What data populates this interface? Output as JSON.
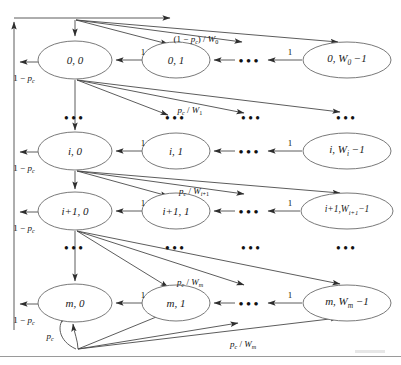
{
  "figure": {
    "type": "state-transition-diagram",
    "bg_color": "#ffffff",
    "line_color": "#4a4a4a",
    "text_color": "#111111"
  },
  "nodes": [
    {
      "id": "s00",
      "label": "0, 0",
      "row": 0,
      "col": 0,
      "cx": 75,
      "cy": 60,
      "rx": 37,
      "ry": 19
    },
    {
      "id": "s01",
      "label": "0, 1",
      "row": 0,
      "col": 1,
      "cx": 176,
      "cy": 60,
      "rx": 34,
      "ry": 18
    },
    {
      "id": "s0W",
      "label": "0, W_0 - 1",
      "row": 0,
      "col": 3,
      "cx": 347,
      "cy": 60,
      "rx": 44,
      "ry": 18
    },
    {
      "id": "si0",
      "label": "i, 0",
      "row": 1,
      "col": 0,
      "cx": 75,
      "cy": 151,
      "rx": 37,
      "ry": 19
    },
    {
      "id": "si1",
      "label": "i, 1",
      "row": 1,
      "col": 1,
      "cx": 176,
      "cy": 151,
      "rx": 34,
      "ry": 18
    },
    {
      "id": "siW",
      "label": "i, W_i - 1",
      "row": 1,
      "col": 3,
      "cx": 347,
      "cy": 151,
      "rx": 44,
      "ry": 18
    },
    {
      "id": "si10",
      "label": "i+1, 0",
      "row": 2,
      "col": 0,
      "cx": 75,
      "cy": 211,
      "rx": 37,
      "ry": 19
    },
    {
      "id": "si11",
      "label": "i+1, 1",
      "row": 2,
      "col": 1,
      "cx": 176,
      "cy": 211,
      "rx": 34,
      "ry": 18
    },
    {
      "id": "si1W",
      "label": "i+1, W_{i+1} - 1",
      "row": 2,
      "col": 3,
      "cx": 347,
      "cy": 211,
      "rx": 46,
      "ry": 18
    },
    {
      "id": "sm0",
      "label": "m, 0",
      "row": 3,
      "col": 0,
      "cx": 75,
      "cy": 303,
      "rx": 37,
      "ry": 19
    },
    {
      "id": "sm1",
      "label": "m, 1",
      "row": 3,
      "col": 1,
      "cx": 176,
      "cy": 303,
      "rx": 34,
      "ry": 18
    },
    {
      "id": "smW",
      "label": "m, W_m - 1",
      "row": 3,
      "col": 3,
      "cx": 347,
      "cy": 303,
      "rx": 44,
      "ry": 18
    }
  ],
  "node_labels": {
    "s00": {
      "html": "0, 0"
    },
    "s01": {
      "html": "0, 1"
    },
    "s0W": {
      "html": "0, <span class=\"ital\">W</span><sub>0</sub> &#8722;1"
    },
    "si0": {
      "html": "<span class=\"ital\">i</span>, 0"
    },
    "si1": {
      "html": "<span class=\"ital\">i</span>, 1"
    },
    "siW": {
      "html": "<span class=\"ital\">i</span>, <span class=\"ital\">W</span><sub><span class=\"ital\">i</span></sub> &#8722;1"
    },
    "si10": {
      "html": "<span class=\"ital\">i</span>+1, 0"
    },
    "si11": {
      "html": "<span class=\"ital\">i</span>+1, 1"
    },
    "si1W": {
      "html": "<span class=\"ital\">i</span>+1,<span class=\"ital\">W</span><sub><span class=\"ital\">i</span>+1</sub>&#8722;1"
    },
    "sm0": {
      "html": "<span class=\"ital\">m</span>, 0"
    },
    "sm1": {
      "html": "<span class=\"ital\">m</span>, 1"
    },
    "smW": {
      "html": "<span class=\"ital\">m</span>, <span class=\"ital\">W</span><sub><span class=\"ital\">m</span></sub> &#8722;1"
    }
  },
  "edge_labels": [
    {
      "id": "lbl-1mpc-row0",
      "html": "1 &#8722; <span class=\"ital\">p</span><sub><span class=\"ital\">c</span></sub>",
      "x": 24,
      "y": 79,
      "size": 9
    },
    {
      "id": "lbl-1mpc-rowi",
      "html": "1 &#8722; <span class=\"ital\">p</span><sub><span class=\"ital\">c</span></sub>",
      "x": 24,
      "y": 169,
      "size": 9
    },
    {
      "id": "lbl-1mpc-rowi1",
      "html": "1 &#8722; <span class=\"ital\">p</span><sub><span class=\"ital\">c</span></sub>",
      "x": 24,
      "y": 229,
      "size": 9
    },
    {
      "id": "lbl-1mpc-rowm",
      "html": "1 &#8722; <span class=\"ital\">p</span><sub><span class=\"ital\">c</span></sub>",
      "x": 24,
      "y": 321,
      "size": 9
    },
    {
      "id": "lbl-1mpc-W0",
      "html": "(1 &#8722; <span class=\"ital\">p</span><sub><span class=\"ital\">c</span></sub>) / <span class=\"ital\">W</span><sub>0</sub>",
      "x": 196,
      "y": 40,
      "size": 9
    },
    {
      "id": "lbl-pc-W1",
      "html": "<span class=\"ital\">p</span><sub><span class=\"ital\">c</span></sub> / <span class=\"ital\">W</span><sub>1</sub>",
      "x": 190,
      "y": 111,
      "size": 9
    },
    {
      "id": "lbl-pc-Wi1",
      "html": "<span class=\"ital\">p</span><sub><span class=\"ital\">c</span></sub> / <span class=\"ital\">W</span><sub><span class=\"ital\">i</span>+1</sub>",
      "x": 194,
      "y": 192,
      "size": 9
    },
    {
      "id": "lbl-pc-Wm",
      "html": "<span class=\"ital\">p</span><sub><span class=\"ital\">c</span></sub> / <span class=\"ital\">W</span><sub><span class=\"ital\">m</span></sub>",
      "x": 190,
      "y": 283,
      "size": 9
    },
    {
      "id": "lbl-pc-self",
      "html": "<span class=\"ital\">p</span><sub><span class=\"ital\">c</span></sub>",
      "x": 50,
      "y": 337,
      "size": 9
    },
    {
      "id": "lbl-pc-Wm-bot",
      "html": "<span class=\"ital\">p</span><sub><span class=\"ital\">c</span></sub> / <span class=\"ital\">W</span><sub><span class=\"ital\">m</span></sub>",
      "x": 243,
      "y": 345,
      "size": 9
    },
    {
      "id": "lbl-one-r0c1",
      "html": "1",
      "x": 143,
      "y": 52,
      "size": 9
    },
    {
      "id": "lbl-one-r0c2",
      "html": "1",
      "x": 290,
      "y": 52,
      "size": 9
    },
    {
      "id": "lbl-one-r1c1",
      "html": "1",
      "x": 143,
      "y": 143,
      "size": 9
    },
    {
      "id": "lbl-one-r1c2",
      "html": "1",
      "x": 290,
      "y": 143,
      "size": 9
    },
    {
      "id": "lbl-one-r2c1",
      "html": "1",
      "x": 143,
      "y": 203,
      "size": 9
    },
    {
      "id": "lbl-one-r2c2",
      "html": "1",
      "x": 290,
      "y": 203,
      "size": 9
    },
    {
      "id": "lbl-one-r3c1",
      "html": "1",
      "x": 143,
      "y": 295,
      "size": 9
    },
    {
      "id": "lbl-one-r3c2",
      "html": "1",
      "x": 290,
      "y": 295,
      "size": 9
    }
  ],
  "horizontal_ellipses": [
    {
      "id": "hdots-row0",
      "x": 250,
      "y": 60
    },
    {
      "id": "hdots-row1",
      "x": 250,
      "y": 151
    },
    {
      "id": "hdots-row2",
      "x": 250,
      "y": 211
    },
    {
      "id": "hdots-row3",
      "x": 250,
      "y": 303
    }
  ],
  "vertical_ellipses": [
    {
      "id": "vdots-a-c0",
      "x": 75,
      "y": 118
    },
    {
      "id": "vdots-a-c1",
      "x": 176,
      "y": 118
    },
    {
      "id": "vdots-a-c2",
      "x": 252,
      "y": 118
    },
    {
      "id": "vdots-a-c3",
      "x": 347,
      "y": 118
    },
    {
      "id": "vdots-b-c0",
      "x": 75,
      "y": 248
    },
    {
      "id": "vdots-b-c1",
      "x": 176,
      "y": 248
    },
    {
      "id": "vdots-b-c2",
      "x": 252,
      "y": 248
    },
    {
      "id": "vdots-b-c3",
      "x": 347,
      "y": 248
    }
  ],
  "footer": {
    "rule_y": 356
  }
}
